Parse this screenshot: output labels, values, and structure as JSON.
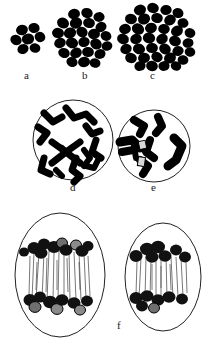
{
  "figure": {
    "background_color": "#ffffff",
    "ink_color": "#000000",
    "outline_color": "#222222",
    "width": 216,
    "height": 348
  },
  "panels": [
    {
      "id": "a",
      "label": "a",
      "label_x": 26,
      "label_y": 72,
      "kind": "cell-cluster",
      "description": "small cluster of darkly stained cells",
      "cell_count": 7,
      "center_x": 30,
      "center_y": 38
    },
    {
      "id": "b",
      "label": "b",
      "label_x": 84,
      "label_y": 72,
      "kind": "cell-cluster",
      "description": "medium cluster of darkly stained cells",
      "cell_count": 24,
      "center_x": 82,
      "center_y": 36
    },
    {
      "id": "c",
      "label": "c",
      "label_x": 152,
      "label_y": 72,
      "kind": "cell-cluster",
      "description": "large cluster of darkly stained cells",
      "cell_count": 38,
      "center_x": 152,
      "center_y": 33
    },
    {
      "id": "d",
      "label": "d",
      "label_x": 70,
      "label_y": 185,
      "kind": "nucleus-circle",
      "description": "circular nucleus with condensed chromosomes (prophase)",
      "center_x": 73,
      "center_y": 140,
      "radius": 40,
      "chromosome_count": 8
    },
    {
      "id": "e",
      "label": "e",
      "label_x": 152,
      "label_y": 185,
      "kind": "nucleus-circle",
      "description": "circular nucleus with fewer, thicker chromosomes",
      "center_x": 154,
      "center_y": 146,
      "radius": 36,
      "chromosome_count": 6
    },
    {
      "id": "f",
      "label": "f",
      "label_x": 118,
      "label_y": 322,
      "kind": "dividing-cells",
      "description": "two oval cells in anaphase with spindle fibres and chromosomes drawn to the poles",
      "cells": [
        {
          "name": "left-anaphase-cell",
          "center_x": 60,
          "center_y": 275,
          "rx": 45,
          "ry": 62,
          "spindle_fibre_count": 18,
          "chromosome_groups": 2
        },
        {
          "name": "right-anaphase-cell",
          "center_x": 163,
          "center_y": 277,
          "rx": 38,
          "ry": 54,
          "spindle_fibre_count": 14,
          "chromosome_groups": 2
        }
      ]
    }
  ],
  "labels": {
    "a": "a",
    "b": "b",
    "c": "c",
    "d": "d",
    "e": "e",
    "f": "f"
  }
}
